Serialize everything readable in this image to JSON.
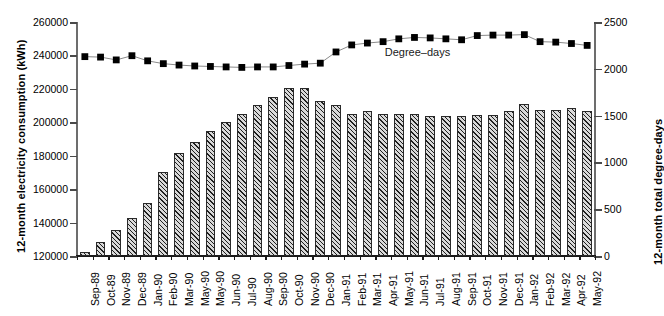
{
  "chart_data": {
    "type": "bar",
    "title": "",
    "subtitle": "",
    "xlabel": "",
    "ylabel": "12-month electricity consumption (kWh)",
    "y2label": "12-month total degree-days",
    "ylim": [
      120000,
      260000
    ],
    "y2lim": [
      0,
      2500
    ],
    "yticks": [
      "120000",
      "140000",
      "160000",
      "180000",
      "200000",
      "220000",
      "240000",
      "260000"
    ],
    "ytick_values": [
      120000,
      140000,
      160000,
      180000,
      200000,
      220000,
      240000,
      260000
    ],
    "y2ticks": [
      "0",
      "500",
      "1000",
      "1500",
      "2000",
      "2500"
    ],
    "y2tick_values": [
      0,
      500,
      1000,
      1500,
      2000,
      2500
    ],
    "grid": false,
    "legend_position": "inline-annotation",
    "categories": [
      "Sep-89",
      "Oct-89",
      "Nov-89",
      "Dec-89",
      "Jan-90",
      "Feb-90",
      "Mar-90",
      "May-90",
      "May-90",
      "Jun-90",
      "Jul-90",
      "Aug-90",
      "Sep-90",
      "Oct-90",
      "Nov-90",
      "Dec-90",
      "Jan-91",
      "Feb-91",
      "Mar-91",
      "Apr-91",
      "May-91",
      "Jun-91",
      "Jul-91",
      "Aug-91",
      "Sep-91",
      "Oct-91",
      "Nov-91",
      "Dec-91",
      "Jan-92",
      "Feb-92",
      "Mar-92",
      "Apr-92",
      "May-92"
    ],
    "series": [
      {
        "name": "12-month electricity consumption (kWh)",
        "type": "bar",
        "axis": "left",
        "unit": "kWh",
        "values": [
          122500,
          128500,
          135500,
          143000,
          152000,
          170500,
          181500,
          188500,
          195000,
          200000,
          205000,
          210500,
          215000,
          220500,
          220500,
          213000,
          210500,
          205000,
          206500,
          205000,
          205000,
          205000,
          203500,
          203500,
          203500,
          204500,
          204500,
          206500,
          211000,
          207500,
          207500,
          208500,
          207000
        ]
      },
      {
        "name": "Degree-days",
        "type": "line",
        "axis": "right",
        "unit": "degree-days",
        "marker": "filled-square",
        "values": [
          2130,
          2125,
          2095,
          2140,
          2085,
          2055,
          2040,
          2030,
          2025,
          2020,
          2015,
          2020,
          2020,
          2035,
          2050,
          2060,
          2180,
          2255,
          2275,
          2290,
          2320,
          2335,
          2330,
          2320,
          2310,
          2355,
          2360,
          2360,
          2365,
          2290,
          2285,
          2270,
          2250
        ],
        "annotation": "Degree–days"
      }
    ]
  },
  "annotations": {
    "series_label": "Degree–days"
  }
}
